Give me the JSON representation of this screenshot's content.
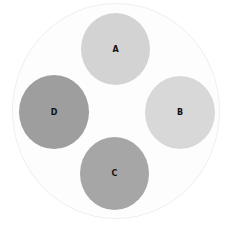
{
  "diagram": {
    "type": "circle-arrangement",
    "container": "outer-circle",
    "circles": [
      {
        "id": "A",
        "label": "A",
        "position": "top",
        "color": "#d3d3d3"
      },
      {
        "id": "B",
        "label": "B",
        "position": "right",
        "color": "#d8d8d8"
      },
      {
        "id": "C",
        "label": "C",
        "position": "bottom",
        "color": "#a6a6a6"
      },
      {
        "id": "D",
        "label": "D",
        "position": "left",
        "color": "#9e9e9e"
      }
    ]
  }
}
